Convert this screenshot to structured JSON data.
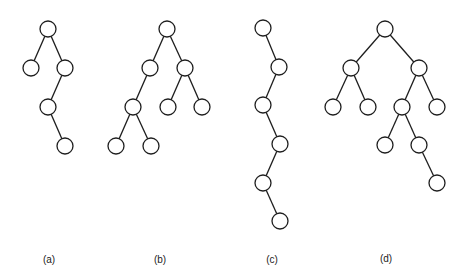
{
  "figure": {
    "node_radius": 8,
    "stroke_color": "#1e1e1e",
    "trees": [
      {
        "id": "a",
        "label": "(a)",
        "label_pos": [
          49,
          254
        ],
        "nodes": [
          [
            48,
            29
          ],
          [
            31,
            68
          ],
          [
            65,
            68
          ],
          [
            48,
            107
          ],
          [
            65,
            146
          ]
        ],
        "edges": [
          [
            0,
            1
          ],
          [
            0,
            2
          ],
          [
            2,
            3
          ],
          [
            3,
            4
          ]
        ]
      },
      {
        "id": "b",
        "label": "(b)",
        "label_pos": [
          160,
          254
        ],
        "nodes": [
          [
            167,
            29
          ],
          [
            150,
            68
          ],
          [
            185,
            68
          ],
          [
            133,
            107
          ],
          [
            168,
            107
          ],
          [
            202,
            107
          ],
          [
            116,
            146
          ],
          [
            151,
            146
          ]
        ],
        "edges": [
          [
            0,
            1
          ],
          [
            0,
            2
          ],
          [
            1,
            3
          ],
          [
            2,
            4
          ],
          [
            2,
            5
          ],
          [
            3,
            6
          ],
          [
            3,
            7
          ]
        ]
      },
      {
        "id": "c",
        "label": "(c)",
        "label_pos": [
          272,
          254
        ],
        "nodes": [
          [
            263,
            28
          ],
          [
            279,
            67
          ],
          [
            263,
            105
          ],
          [
            280,
            144
          ],
          [
            263,
            183
          ],
          [
            280,
            221
          ]
        ],
        "edges": [
          [
            0,
            1
          ],
          [
            1,
            2
          ],
          [
            2,
            3
          ],
          [
            3,
            4
          ],
          [
            4,
            5
          ]
        ]
      },
      {
        "id": "d",
        "label": "(d)",
        "label_pos": [
          386,
          253
        ],
        "nodes": [
          [
            385,
            29
          ],
          [
            351,
            68
          ],
          [
            419,
            68
          ],
          [
            333,
            107
          ],
          [
            368,
            107
          ],
          [
            402,
            107
          ],
          [
            437,
            107
          ],
          [
            385,
            145
          ],
          [
            419,
            145
          ],
          [
            437,
            183
          ]
        ],
        "edges": [
          [
            0,
            1
          ],
          [
            0,
            2
          ],
          [
            1,
            3
          ],
          [
            1,
            4
          ],
          [
            2,
            5
          ],
          [
            2,
            6
          ],
          [
            5,
            7
          ],
          [
            5,
            8
          ],
          [
            8,
            9
          ]
        ]
      }
    ]
  }
}
